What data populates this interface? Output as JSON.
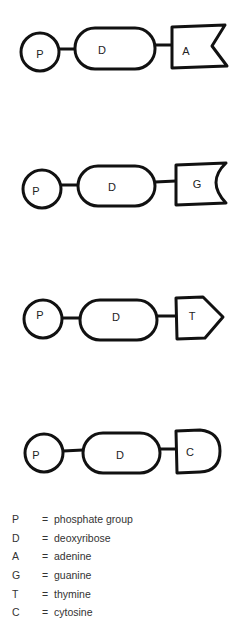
{
  "nucleotides": [
    {
      "phosphate": "P",
      "sugar": "D",
      "base": "A",
      "base_shape": "flag-notch"
    },
    {
      "phosphate": "P",
      "sugar": "D",
      "base": "G",
      "base_shape": "concave-arc"
    },
    {
      "phosphate": "P",
      "sugar": "D",
      "base": "T",
      "base_shape": "arrow-point"
    },
    {
      "phosphate": "P",
      "sugar": "D",
      "base": "C",
      "base_shape": "rounded"
    }
  ],
  "legend": [
    {
      "key": "P",
      "eq": "=",
      "meaning": "phosphate group"
    },
    {
      "key": "D",
      "eq": "=",
      "meaning": "deoxyribose"
    },
    {
      "key": "A",
      "eq": "=",
      "meaning": "adenine"
    },
    {
      "key": "G",
      "eq": "=",
      "meaning": "guanine"
    },
    {
      "key": "T",
      "eq": "=",
      "meaning": "thymine"
    },
    {
      "key": "C",
      "eq": "=",
      "meaning": "cytosine"
    }
  ]
}
